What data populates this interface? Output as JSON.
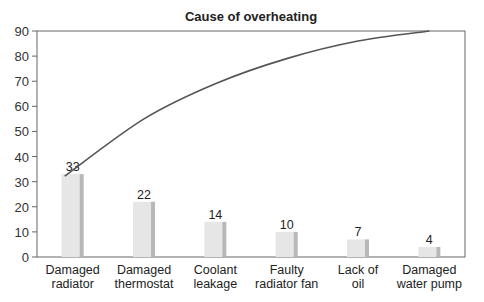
{
  "chart_data": {
    "type": "bar",
    "title": "Cause of overheating",
    "xlabel": "",
    "ylabel": "",
    "ylim": [
      0,
      90
    ],
    "yticks": [
      0,
      10,
      20,
      30,
      40,
      50,
      60,
      70,
      80,
      90
    ],
    "grid": false,
    "legend": null,
    "categories": [
      [
        "Damaged",
        "radiator"
      ],
      [
        "Damaged",
        "thermostat"
      ],
      [
        "Coolant",
        "leakage"
      ],
      [
        "Faulty",
        "radiator fan"
      ],
      [
        "Lack of",
        "oil"
      ],
      [
        "Damaged",
        "water pump"
      ]
    ],
    "values": [
      33,
      22,
      14,
      10,
      7,
      4
    ],
    "series": [
      {
        "name": "Count",
        "type": "bar",
        "values": [
          33,
          22,
          14,
          10,
          7,
          4
        ]
      },
      {
        "name": "Cumulative",
        "type": "line",
        "values": [
          33,
          55,
          69,
          79,
          86,
          90
        ]
      }
    ],
    "colors": {
      "bar_face": "#e6e6e6",
      "bar_side": "#b8b8b8",
      "line": "#555555",
      "axis": "#666666"
    }
  }
}
